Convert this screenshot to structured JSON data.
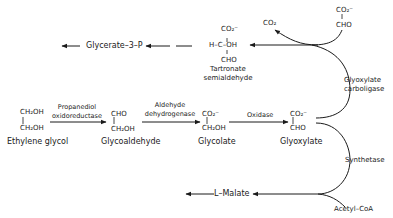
{
  "diagram": {
    "type": "metabolic-pathway",
    "nodes": {
      "ethylene_glycol": {
        "label": "Ethylene glycol",
        "formula_top": "CH₂OH",
        "formula_bottom": "CH₂OH"
      },
      "glycoaldehyde": {
        "label": "Glycoaldehyde",
        "formula_top": "CHO",
        "formula_bottom": "CH₂OH"
      },
      "glycolate": {
        "label": "Glycolate",
        "formula_top": "CO₂⁻",
        "formula_bottom": "CH₂OH"
      },
      "glyoxylate": {
        "label": "Glyoxylate",
        "formula_top": "CO₂⁻",
        "formula_bottom": "CHO"
      },
      "glyoxylate_top": {
        "formula_top": "CO₂⁻",
        "formula_bottom": "CHO"
      },
      "tartronate": {
        "label_line1": "Tartronate",
        "label_line2": "semialdehyde",
        "formula_top": "CO₂⁻",
        "formula_mid": "H–C–OH",
        "formula_bottom": "CHO"
      },
      "glycerate": {
        "label": "Glycerate–3–P"
      },
      "co2": {
        "label": "CO₂"
      },
      "l_malate": {
        "label": "L–Malate"
      },
      "acetyl_coa": {
        "label": "Acetyl–CoA"
      }
    },
    "enzymes": {
      "propanediol": {
        "line1": "Propanediol",
        "line2": "oxidoreductase"
      },
      "aldehyde_dh": {
        "line1": "Aldehyde",
        "line2": "dehydrogenase"
      },
      "oxidase": {
        "label": "Oxidase"
      },
      "carboligase": {
        "line1": "Glyoxylate",
        "line2": "carboligase"
      },
      "synthetase": {
        "label": "Synthetase"
      }
    },
    "edges": [
      {
        "from": "Ethylene glycol",
        "to": "Glycoaldehyde",
        "enzyme": "Propanediol oxidoreductase"
      },
      {
        "from": "Glycoaldehyde",
        "to": "Glycolate",
        "enzyme": "Aldehyde dehydrogenase"
      },
      {
        "from": "Glycolate",
        "to": "Glyoxylate",
        "enzyme": "Oxidase"
      },
      {
        "from": "Glyoxylate + Glyoxylate",
        "to": "Tartronate semialdehyde + CO2",
        "enzyme": "Glyoxylate carboligase"
      },
      {
        "from": "Tartronate semialdehyde",
        "to": "Glycerate-3-P"
      },
      {
        "from": "Glyoxylate + Acetyl-CoA",
        "to": "L-Malate",
        "enzyme": "Synthetase"
      }
    ]
  }
}
